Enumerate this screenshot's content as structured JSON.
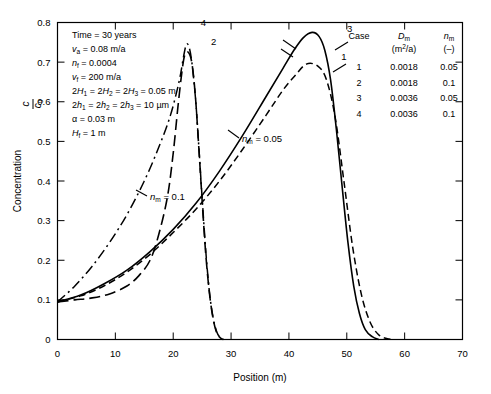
{
  "chart_data": {
    "type": "line",
    "title": "",
    "xlabel": "Position (m)",
    "ylabel": "Concentration c/c0",
    "xlim": [
      0,
      70
    ],
    "ylim": [
      0,
      0.8
    ],
    "xticks": [
      "0",
      "10",
      "20",
      "30",
      "40",
      "50",
      "60",
      "70"
    ],
    "yticks": [
      "0",
      "0.1",
      "0.2",
      "0.3",
      "0.4",
      "0.5",
      "0.6",
      "0.7",
      "0.8"
    ],
    "grid": false,
    "legend_position": "upper-right-table",
    "series": [
      {
        "name": "1",
        "style": "dashed",
        "Dm": "0.0018",
        "nm": "0.05",
        "points": [
          [
            0,
            0.095
          ],
          [
            4,
            0.11
          ],
          [
            8,
            0.135
          ],
          [
            12,
            0.17
          ],
          [
            16,
            0.215
          ],
          [
            20,
            0.27
          ],
          [
            24,
            0.33
          ],
          [
            28,
            0.4
          ],
          [
            32,
            0.48
          ],
          [
            36,
            0.565
          ],
          [
            39,
            0.63
          ],
          [
            41,
            0.665
          ],
          [
            43,
            0.695
          ],
          [
            45,
            0.69
          ],
          [
            46.5,
            0.655
          ],
          [
            48,
            0.56
          ],
          [
            49.5,
            0.4
          ],
          [
            51,
            0.235
          ],
          [
            52.5,
            0.115
          ],
          [
            54,
            0.045
          ],
          [
            55.5,
            0.012
          ],
          [
            57,
            0.002
          ],
          [
            58,
            0.0
          ]
        ]
      },
      {
        "name": "2",
        "style": "long-dashed",
        "Dm": "0.0018",
        "nm": "0.1",
        "points": [
          [
            0,
            0.095
          ],
          [
            3,
            0.1
          ],
          [
            6,
            0.105
          ],
          [
            9,
            0.115
          ],
          [
            12,
            0.135
          ],
          [
            14,
            0.16
          ],
          [
            16,
            0.2
          ],
          [
            17.5,
            0.265
          ],
          [
            19,
            0.36
          ],
          [
            20,
            0.47
          ],
          [
            20.8,
            0.585
          ],
          [
            21.5,
            0.675
          ],
          [
            22,
            0.718
          ],
          [
            22.6,
            0.725
          ],
          [
            23.2,
            0.7
          ],
          [
            23.8,
            0.62
          ],
          [
            24.4,
            0.49
          ],
          [
            25,
            0.35
          ],
          [
            25.6,
            0.22
          ],
          [
            26.2,
            0.125
          ],
          [
            26.8,
            0.06
          ],
          [
            27.4,
            0.022
          ],
          [
            28,
            0.006
          ],
          [
            28.6,
            0.0
          ]
        ]
      },
      {
        "name": "3",
        "style": "solid",
        "Dm": "0.0036",
        "nm": "0.05",
        "points": [
          [
            0,
            0.095
          ],
          [
            4,
            0.112
          ],
          [
            8,
            0.14
          ],
          [
            12,
            0.175
          ],
          [
            16,
            0.222
          ],
          [
            20,
            0.278
          ],
          [
            24,
            0.345
          ],
          [
            28,
            0.425
          ],
          [
            32,
            0.515
          ],
          [
            36,
            0.612
          ],
          [
            39,
            0.685
          ],
          [
            41,
            0.733
          ],
          [
            42.5,
            0.762
          ],
          [
            44,
            0.775
          ],
          [
            45.2,
            0.765
          ],
          [
            46.2,
            0.73
          ],
          [
            47.2,
            0.655
          ],
          [
            48.2,
            0.53
          ],
          [
            49.2,
            0.385
          ],
          [
            50.2,
            0.245
          ],
          [
            51.2,
            0.135
          ],
          [
            52.2,
            0.065
          ],
          [
            53.2,
            0.025
          ],
          [
            54.4,
            0.007
          ],
          [
            55.5,
            0.0
          ]
        ]
      },
      {
        "name": "4",
        "style": "dash-dot",
        "Dm": "0.0036",
        "nm": "0.1",
        "points": [
          [
            0,
            0.095
          ],
          [
            3,
            0.135
          ],
          [
            6,
            0.185
          ],
          [
            9,
            0.245
          ],
          [
            12,
            0.315
          ],
          [
            15,
            0.4
          ],
          [
            17.5,
            0.485
          ],
          [
            19.5,
            0.565
          ],
          [
            21,
            0.65
          ],
          [
            21.8,
            0.715
          ],
          [
            22.3,
            0.745
          ],
          [
            22.8,
            0.735
          ],
          [
            23.3,
            0.69
          ],
          [
            23.9,
            0.6
          ],
          [
            24.5,
            0.47
          ],
          [
            25.1,
            0.335
          ],
          [
            25.7,
            0.21
          ],
          [
            26.3,
            0.115
          ],
          [
            26.9,
            0.055
          ],
          [
            27.5,
            0.02
          ],
          [
            28.1,
            0.005
          ],
          [
            28.7,
            0.0
          ]
        ]
      }
    ],
    "curve_labels": [
      {
        "text": "1",
        "x": 49.5,
        "y": 0.705
      },
      {
        "text": "2",
        "x": 27.0,
        "y": 0.742
      },
      {
        "text": "3",
        "x": 50.5,
        "y": 0.775
      },
      {
        "text": "4",
        "x": 25.2,
        "y": 0.792
      }
    ],
    "annotations": [
      {
        "text": "n_m = 0.1",
        "x": 15.5,
        "y": 0.385
      },
      {
        "text": "n_m = 0.05",
        "x": 31.0,
        "y": 0.498
      }
    ]
  },
  "params": {
    "lines": [
      {
        "lhs": "Time",
        "rhs": "30 years",
        "sub": ""
      },
      {
        "lhs": "v",
        "sub": "a",
        "rhs": "0.08 m/a"
      },
      {
        "lhs": "n",
        "sub": "f",
        "rhs": "0.0004"
      },
      {
        "lhs": "v",
        "sub": "f",
        "rhs": "200 m/a"
      },
      {
        "lhs": "2H1 = 2H2 = 2H3",
        "rhs": "0.05 m"
      },
      {
        "lhs": "2h1 = 2h2 = 2h3",
        "rhs": "10 µm"
      },
      {
        "lhs": "α",
        "rhs": "0.03 m"
      },
      {
        "lhs": "H",
        "sub": "f",
        "rhs": "1 m"
      }
    ]
  },
  "legend": {
    "headers": {
      "case": "Case",
      "dm": "D",
      "dm_sub": "m",
      "dm_unit": "(m2/a)",
      "nm": "n",
      "nm_sub": "m",
      "nm_unit": "(–)"
    },
    "rows": [
      {
        "case": "1",
        "dm": "0.0018",
        "nm": "0.05"
      },
      {
        "case": "2",
        "dm": "0.0018",
        "nm": "0.1"
      },
      {
        "case": "3",
        "dm": "0.0036",
        "nm": "0.05"
      },
      {
        "case": "4",
        "dm": "0.0036",
        "nm": "0.1"
      }
    ]
  },
  "axes": {
    "xlabel": "Position (m)",
    "ylabel_main": "Concentration",
    "ylabel_num": "c",
    "ylabel_den": "c",
    "ylabel_den_sub": "0"
  }
}
